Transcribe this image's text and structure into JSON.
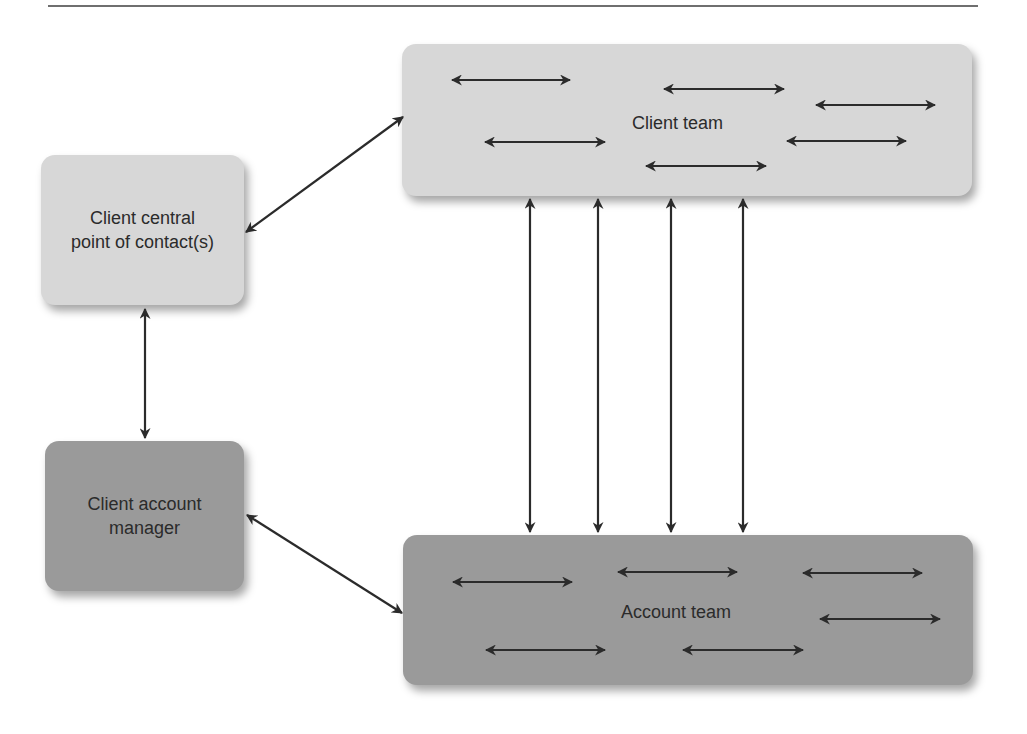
{
  "figure": {
    "nodes": {
      "client_contact": {
        "label_lines": [
          "Client central",
          "point of contact(s)"
        ],
        "shade": "light",
        "color": "#d7d7d7"
      },
      "client_team": {
        "label": "Client team",
        "shade": "light",
        "color": "#d7d7d7"
      },
      "account_manager": {
        "label_lines": [
          "Client account",
          "manager"
        ],
        "shade": "dark",
        "color": "#9a9a9a"
      },
      "account_team": {
        "label": "Account team",
        "shade": "dark",
        "color": "#9a9a9a"
      }
    },
    "edges": [
      {
        "from": "client_contact",
        "to": "client_team",
        "type": "bidirectional"
      },
      {
        "from": "client_contact",
        "to": "account_manager",
        "type": "bidirectional"
      },
      {
        "from": "account_manager",
        "to": "account_team",
        "type": "bidirectional"
      },
      {
        "from": "client_team",
        "to": "account_team",
        "type": "bidirectional",
        "count": 4
      }
    ],
    "internal_arrows": {
      "client_team": 6,
      "account_team": 6
    },
    "arrow_color": "#2b2b2b"
  }
}
